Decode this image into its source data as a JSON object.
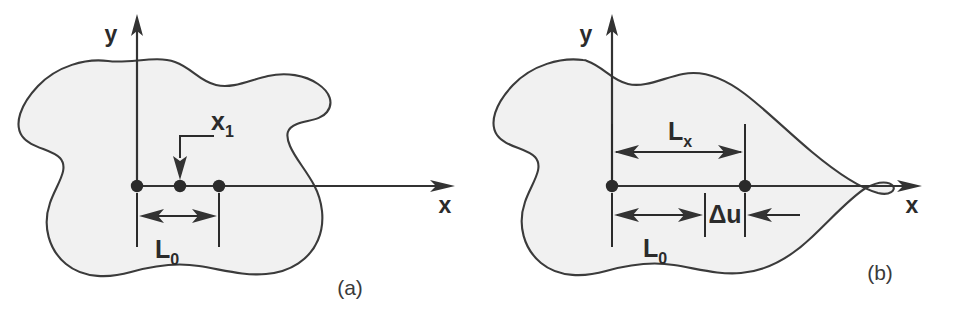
{
  "figure": {
    "background_color": "#ffffff",
    "blob_fill_color": "#f1f1f1",
    "blob_stroke_color": "#3b3b3b",
    "line_color": "#2b2b2b"
  },
  "panel_a": {
    "caption": "(a)",
    "axis_y_label": "y",
    "axis_x_label": "x",
    "point_label": "x",
    "point_label_subscript": "1",
    "dimension_label": "L",
    "dimension_label_subscript": "0",
    "node_count": 3
  },
  "panel_b": {
    "caption": "(b)",
    "axis_y_label": "y",
    "axis_x_label": "x",
    "dimension_upper_label": "L",
    "dimension_upper_subscript": "x",
    "dimension_lower_label": "L",
    "dimension_lower_subscript": "0",
    "displacement_label": "Δu",
    "node_count": 2
  }
}
